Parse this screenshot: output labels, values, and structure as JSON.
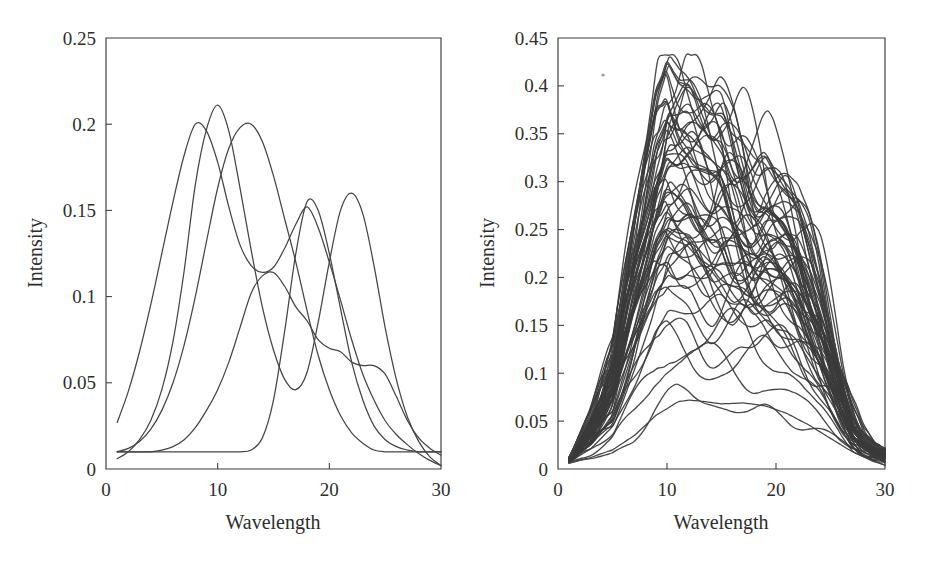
{
  "figure": {
    "background_color": "#ffffff",
    "line_color": "#454545",
    "axis_color": "#3a3a3a",
    "panel_count": 2
  },
  "chart_data": [
    {
      "type": "line",
      "panel": "left",
      "title": "",
      "xlabel": "Wavelength",
      "ylabel": "Intensity",
      "xlim": [
        0,
        30
      ],
      "ylim": [
        0,
        0.25
      ],
      "xticks": [
        0,
        10,
        20,
        30
      ],
      "xtick_labels": [
        "0",
        "10",
        "20",
        "30"
      ],
      "yticks": [
        0,
        0.05,
        0.1,
        0.15,
        0.2,
        0.25
      ],
      "ytick_labels": [
        "0",
        "0.05",
        "0.1",
        "0.15",
        "0.2",
        "0.25"
      ],
      "grid": false,
      "legend": null,
      "x": [
        1,
        2,
        3,
        4,
        5,
        6,
        7,
        8,
        9,
        10,
        11,
        12,
        13,
        14,
        15,
        16,
        17,
        18,
        19,
        20,
        21,
        22,
        23,
        24,
        25,
        26,
        27,
        28,
        29,
        30
      ],
      "series": [
        {
          "name": "pure-component-1",
          "values": [
            0.027,
            0.045,
            0.068,
            0.095,
            0.125,
            0.155,
            0.182,
            0.2,
            0.196,
            0.178,
            0.152,
            0.13,
            0.118,
            0.114,
            0.117,
            0.128,
            0.142,
            0.152,
            0.14,
            0.12,
            0.098,
            0.075,
            0.055,
            0.04,
            0.028,
            0.02,
            0.014,
            0.009,
            0.005,
            0.002
          ]
        },
        {
          "name": "pure-component-2",
          "values": [
            0.006,
            0.01,
            0.017,
            0.028,
            0.046,
            0.074,
            0.115,
            0.165,
            0.197,
            0.211,
            0.196,
            0.163,
            0.127,
            0.094,
            0.069,
            0.052,
            0.046,
            0.056,
            0.085,
            0.12,
            0.15,
            0.16,
            0.148,
            0.118,
            0.082,
            0.052,
            0.03,
            0.016,
            0.007,
            0.002
          ]
        },
        {
          "name": "pure-component-3",
          "values": [
            0.01,
            0.012,
            0.016,
            0.023,
            0.034,
            0.05,
            0.072,
            0.1,
            0.132,
            0.163,
            0.186,
            0.198,
            0.2,
            0.19,
            0.17,
            0.145,
            0.12,
            0.092,
            0.066,
            0.046,
            0.031,
            0.021,
            0.015,
            0.011,
            0.01,
            0.01,
            0.01,
            0.01,
            0.01,
            0.01
          ]
        },
        {
          "name": "pure-component-4",
          "values": [
            0.01,
            0.01,
            0.01,
            0.01,
            0.01,
            0.01,
            0.01,
            0.01,
            0.01,
            0.01,
            0.01,
            0.01,
            0.011,
            0.018,
            0.04,
            0.08,
            0.125,
            0.155,
            0.15,
            0.125,
            0.093,
            0.062,
            0.04,
            0.025,
            0.017,
            0.013,
            0.011,
            0.01,
            0.01,
            0.01
          ]
        },
        {
          "name": "pure-component-5",
          "values": [
            0.01,
            0.01,
            0.01,
            0.01,
            0.011,
            0.013,
            0.017,
            0.024,
            0.034,
            0.046,
            0.062,
            0.082,
            0.102,
            0.112,
            0.114,
            0.106,
            0.094,
            0.086,
            0.075,
            0.07,
            0.068,
            0.062,
            0.06,
            0.06,
            0.055,
            0.042,
            0.028,
            0.018,
            0.012,
            0.008
          ]
        }
      ]
    },
    {
      "type": "line",
      "panel": "right",
      "title": "",
      "xlabel": "Wavelength",
      "ylabel": "Intensity",
      "xlim": [
        0,
        30
      ],
      "ylim": [
        0,
        0.45
      ],
      "xticks": [
        0,
        10,
        20,
        30
      ],
      "xtick_labels": [
        "0",
        "10",
        "20",
        "30"
      ],
      "yticks": [
        0,
        0.05,
        0.1,
        0.15,
        0.2,
        0.25,
        0.3,
        0.35,
        0.4,
        0.45
      ],
      "ytick_labels": [
        "0",
        "0.05",
        "0.1",
        "0.15",
        "0.2",
        "0.25",
        "0.3",
        "0.35",
        "0.4",
        "0.45"
      ],
      "grid": false,
      "legend": null,
      "series_count": 60,
      "description": "Overlaid mixture spectra forming a dense band peaking near wavelength 10",
      "envelope_upper": {
        "name": "max-envelope",
        "x": [
          1,
          3,
          5,
          7,
          8,
          9,
          10,
          11,
          12,
          13,
          14,
          15,
          16,
          17,
          18,
          19,
          20,
          21,
          22,
          23,
          24,
          25,
          26,
          27,
          28,
          29,
          30
        ],
        "values": [
          0.012,
          0.055,
          0.12,
          0.26,
          0.33,
          0.395,
          0.425,
          0.405,
          0.4,
          0.385,
          0.372,
          0.368,
          0.35,
          0.34,
          0.325,
          0.318,
          0.3,
          0.288,
          0.272,
          0.24,
          0.2,
          0.15,
          0.1,
          0.06,
          0.035,
          0.024,
          0.022
        ]
      },
      "envelope_lower": {
        "name": "min-envelope",
        "x": [
          1,
          3,
          5,
          7,
          9,
          11,
          12,
          13,
          15,
          17,
          19,
          21,
          23,
          25,
          27,
          29,
          30
        ],
        "values": [
          0.006,
          0.012,
          0.02,
          0.035,
          0.056,
          0.07,
          0.072,
          0.071,
          0.068,
          0.069,
          0.066,
          0.058,
          0.046,
          0.032,
          0.018,
          0.008,
          0.004
        ]
      }
    }
  ],
  "left_panel": {
    "name": "pure-component-spectra",
    "axis": {
      "x_title": "Wavelength",
      "y_title": "Intensity",
      "x_ticks": [
        "0",
        "10",
        "20",
        "30"
      ],
      "y_ticks": [
        "0",
        "0.05",
        "0.1",
        "0.15",
        "0.2",
        "0.25"
      ]
    }
  },
  "right_panel": {
    "name": "mixture-spectra",
    "axis": {
      "x_title": "Wavelength",
      "y_title": "Intensity",
      "x_ticks": [
        "0",
        "10",
        "20",
        "30"
      ],
      "y_ticks": [
        "0",
        "0.05",
        "0.1",
        "0.15",
        "0.2",
        "0.25",
        "0.3",
        "0.35",
        "0.4",
        "0.45"
      ]
    }
  }
}
